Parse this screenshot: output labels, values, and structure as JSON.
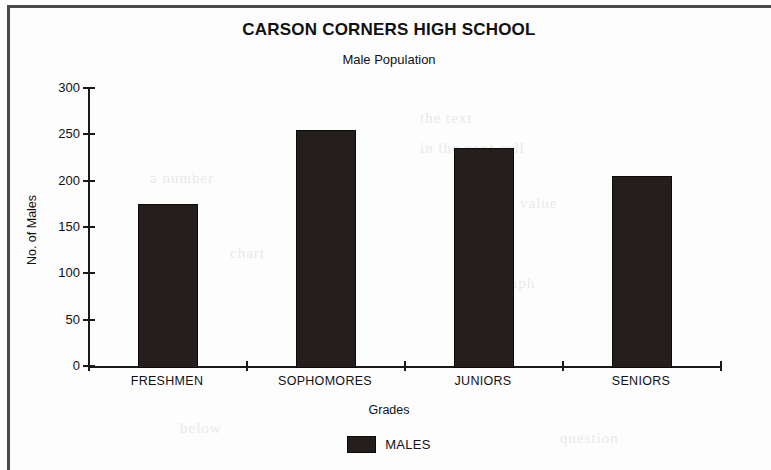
{
  "chart_data": {
    "type": "bar",
    "title": "CARSON CORNERS HIGH SCHOOL",
    "subtitle": "Male Population",
    "xlabel": "Grades",
    "ylabel": "No. of Males",
    "categories": [
      "FRESHMEN",
      "SOPHOMORES",
      "JUNIORS",
      "SENIORS"
    ],
    "values": [
      175,
      255,
      235,
      205
    ],
    "series": [
      {
        "name": "MALES",
        "values": [
          175,
          255,
          235,
          205
        ],
        "color": "#241f1c"
      }
    ],
    "ylim": [
      0,
      300
    ],
    "yticks": [
      0,
      50,
      100,
      150,
      200,
      250,
      300
    ],
    "ytick_labels": [
      "0",
      "50",
      "100",
      "150",
      "200",
      "250",
      "300"
    ],
    "grid": false,
    "legend": {
      "position": "bottom",
      "entries": [
        "MALES"
      ]
    }
  },
  "legend": {
    "males_label": "MALES"
  },
  "ghosts": [
    {
      "text": "the text",
      "left": 420,
      "top": 110
    },
    {
      "text": "in the next cell",
      "left": 420,
      "top": 140
    },
    {
      "text": "a number",
      "left": 150,
      "top": 170
    },
    {
      "text": "value",
      "left": 520,
      "top": 195
    },
    {
      "text": "chart",
      "left": 230,
      "top": 245
    },
    {
      "text": "the graph",
      "left": 470,
      "top": 275
    },
    {
      "text": "below",
      "left": 180,
      "top": 420
    },
    {
      "text": "question",
      "left": 560,
      "top": 430
    }
  ]
}
